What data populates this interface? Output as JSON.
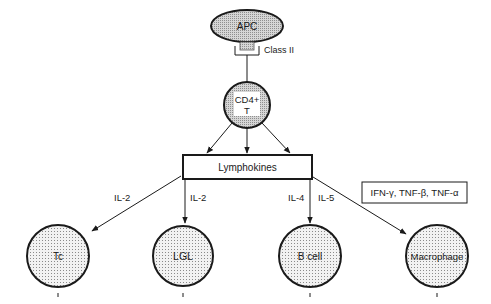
{
  "diagram": {
    "apc": {
      "label": "APC"
    },
    "receptor": {
      "label": "Class II"
    },
    "cd4": {
      "line1": "CD4+",
      "line2": "T"
    },
    "lymphokines": {
      "label": "Lymphokines"
    },
    "cytokine_box": {
      "label": "IFN-γ, TNF-β, TNF-α"
    },
    "edges": {
      "tc": "IL-2",
      "lgl": "IL-2",
      "bcell_left": "IL-4",
      "bcell_right": "IL-5"
    },
    "targets": {
      "tc": "Tc",
      "lgl": "LGL",
      "bcell": "B cell",
      "macrophage": "Macrophage"
    }
  },
  "colors": {
    "stroke": "#1a1a1a",
    "shade_fill": "#c8c8c8",
    "dot_fill": "#e6e6e6",
    "background": "#ffffff"
  }
}
